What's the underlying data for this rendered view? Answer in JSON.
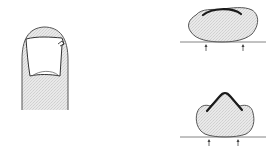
{
  "figure": {
    "panels": [
      {
        "id": "finger-dorsal-view",
        "description": "Fingertip, dorsal view, with nail plate showing lateral edge lifting"
      },
      {
        "id": "cross-section-normal-curvature",
        "description": "Transverse cross-section of fingertip with normally curved nail plate; arrows indicate pressure points"
      },
      {
        "id": "cross-section-pincer-curvature",
        "description": "Transverse cross-section of fingertip with excessively curved (pincer) nail plate; arrows indicate pressure points"
      }
    ]
  },
  "colors": {
    "outline": "#555555",
    "fill": "#e4e4e4",
    "nail": "#1a1a1a",
    "background": "#ffffff"
  }
}
